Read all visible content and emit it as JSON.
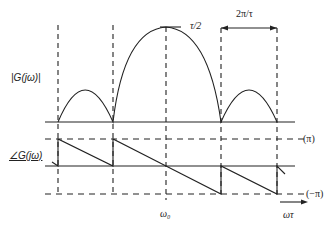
{
  "diagram": {
    "magnitude_label": "|G(jω)|",
    "phase_label": "∠G(jω)",
    "peak_label": "τ/2",
    "period_label": "2π/τ",
    "pi_label": "(π)",
    "neg_pi_label": "(−π)",
    "center_label": "ω₀",
    "axis_label": "ωτ",
    "colors": {
      "line": "#222222",
      "background": "#ffffff"
    }
  }
}
